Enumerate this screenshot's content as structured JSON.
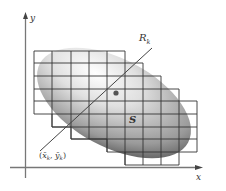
{
  "diagram": {
    "axes": {
      "x_label": "x",
      "y_label": "y"
    },
    "region_label": "S",
    "line_label_main": "R",
    "line_label_sub": "k",
    "point_label": {
      "open": "(",
      "x": "x̄",
      "x_sub": "k",
      "sep": ", ",
      "y": "ȳ",
      "y_sub": "k",
      "close": ")"
    },
    "colors": {
      "axis": "#555555",
      "grid": "#3a3a3a",
      "region_light": "#f2f2f2",
      "region_dark": "#5a5a5a",
      "point": "#555555"
    }
  }
}
